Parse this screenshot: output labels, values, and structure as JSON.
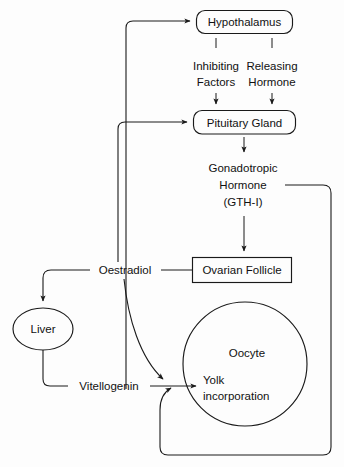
{
  "diagram": {
    "background_color": "#fdfdfd",
    "line_color": "#1a1a1a",
    "text_color": "#111111",
    "nodes": [
      {
        "id": "hypothalamus",
        "label": "Hypothalamus",
        "shape": "rounded-rect"
      },
      {
        "id": "pituitary",
        "label": "Pituitary Gland",
        "shape": "rounded-rect"
      },
      {
        "id": "ovarian_follicle",
        "label": "Ovarian Follicle",
        "shape": "rect"
      },
      {
        "id": "liver",
        "label": "Liver",
        "shape": "ellipse"
      },
      {
        "id": "oocyte",
        "label": "Oocyte",
        "shape": "circle"
      }
    ],
    "edge_labels": [
      {
        "id": "inhibiting_factors",
        "line1": "Inhibiting",
        "line2": "Factors"
      },
      {
        "id": "releasing_hormone",
        "line1": "Releasing",
        "line2": "Hormone"
      },
      {
        "id": "gonadotropic",
        "line1": "Gonadotropic",
        "line2": "Hormone",
        "line3": "(GTH-I)"
      },
      {
        "id": "oestradiol",
        "line1": "Oestradiol"
      },
      {
        "id": "vitellogenin",
        "line1": "Vitellogenin"
      },
      {
        "id": "yolk",
        "line1": "Yolk",
        "line2": "incorporation"
      }
    ]
  },
  "labels": {
    "hypothalamus": "Hypothalamus",
    "pituitary_gland": "Pituitary Gland",
    "ovarian_follicle": "Ovarian Follicle",
    "liver": "Liver",
    "oocyte": "Oocyte",
    "inhibiting_1": "Inhibiting",
    "inhibiting_2": "Factors",
    "releasing_1": "Releasing",
    "releasing_2": "Hormone",
    "gth_1": "Gonadotropic",
    "gth_2": "Hormone",
    "gth_3": "(GTH-I)",
    "oestradiol": "Oestradiol",
    "vitellogenin": "Vitellogenin",
    "yolk_1": "Yolk",
    "yolk_2": "incorporation"
  }
}
